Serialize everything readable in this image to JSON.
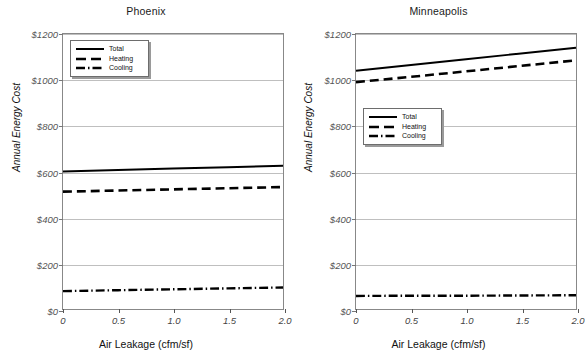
{
  "chart_data": [
    {
      "type": "line",
      "title": "Phoenix",
      "xlabel": "Air Leakage (cfm/sf)",
      "ylabel": "Annual Energy Cost",
      "xlim": [
        0,
        2.0
      ],
      "ylim": [
        0,
        1200
      ],
      "grid": true,
      "legend_position": "top-left",
      "xticks": [
        "0",
        "0.5",
        "1.0",
        "1.5",
        "2.0"
      ],
      "xtick_values": [
        0,
        0.5,
        1.0,
        1.5,
        2.0
      ],
      "yticks": [
        "$0",
        "$200",
        "$400",
        "$600",
        "$800",
        "$1000",
        "$1200"
      ],
      "ytick_values": [
        0,
        200,
        400,
        600,
        800,
        1000,
        1200
      ],
      "x": [
        0,
        0.5,
        1.0,
        1.5,
        2.0
      ],
      "series": [
        {
          "name": "Total",
          "style": "solid",
          "values": [
            600,
            607,
            613,
            619,
            625
          ]
        },
        {
          "name": "Heating",
          "style": "dashed",
          "values": [
            512,
            517,
            522,
            527,
            532
          ]
        },
        {
          "name": "Cooling",
          "style": "dashdot",
          "values": [
            78,
            82,
            86,
            90,
            94
          ]
        }
      ]
    },
    {
      "type": "line",
      "title": "Minneapolis",
      "xlabel": "Air Leakage (cfm/sf)",
      "ylabel": "Annual Energy Cost",
      "xlim": [
        0,
        2.0
      ],
      "ylim": [
        0,
        1200
      ],
      "grid": true,
      "legend_position": "middle-left",
      "xticks": [
        "0",
        "0.5",
        "1.0",
        "1.5",
        "2.0"
      ],
      "xtick_values": [
        0,
        0.5,
        1.0,
        1.5,
        2.0
      ],
      "yticks": [
        "$0",
        "$200",
        "$400",
        "$600",
        "$800",
        "$1000",
        "$1200"
      ],
      "ytick_values": [
        0,
        200,
        400,
        600,
        800,
        1000,
        1200
      ],
      "x": [
        0,
        0.5,
        1.0,
        1.5,
        2.0
      ],
      "series": [
        {
          "name": "Total",
          "style": "solid",
          "values": [
            1040,
            1065,
            1090,
            1115,
            1140
          ]
        },
        {
          "name": "Heating",
          "style": "dashed",
          "values": [
            990,
            1013,
            1037,
            1061,
            1085
          ]
        },
        {
          "name": "Cooling",
          "style": "dashdot",
          "values": [
            57,
            58,
            58,
            59,
            60
          ]
        }
      ]
    }
  ],
  "colors": {
    "series_line": "#000000",
    "gridline": "#bfbfbf",
    "frame": "#888888",
    "tick_text": "#555555",
    "title_text": "#1a1a1a"
  }
}
